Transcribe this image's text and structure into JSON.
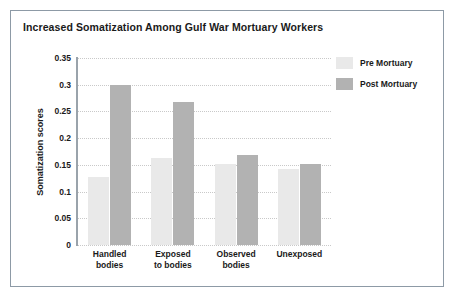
{
  "chart_data": {
    "type": "bar",
    "title": "Increased Somatization Among Gulf War Mortuary Workers",
    "xlabel": "",
    "ylabel": "Somatization scores",
    "categories": [
      "Handled bodies",
      "Exposed to bodies",
      "Observed bodies",
      "Unexposed"
    ],
    "category_lines": [
      [
        "Handled",
        "bodies"
      ],
      [
        "Exposed",
        "to bodies"
      ],
      [
        "Observed",
        "bodies"
      ],
      [
        "Unexposed"
      ]
    ],
    "series": [
      {
        "name": "Pre Mortuary",
        "color": "#e9e9e9",
        "values": [
          0.128,
          0.163,
          0.152,
          0.142
        ]
      },
      {
        "name": "Post Mortuary",
        "color": "#b2b2b2",
        "values": [
          0.3,
          0.268,
          0.168,
          0.152
        ]
      }
    ],
    "ylim": [
      0,
      0.35
    ],
    "yticks": [
      "0",
      "0.05",
      "0.1",
      "0.15",
      "0.2",
      "0.25",
      "0.3",
      "0.35"
    ],
    "ytick_values": [
      0,
      0.05,
      0.1,
      0.15,
      0.2,
      0.25,
      0.3,
      0.35
    ],
    "grid": true,
    "grid_axis": "y",
    "grid_style": "dotted",
    "legend": [
      "Pre Mortuary",
      "Post Mortuary"
    ],
    "legend_position": "right-top"
  },
  "colors": {
    "pre_bar": "#e9e9e9",
    "post_bar": "#b2b2b2",
    "frame_border": "#8d9aa6",
    "axis": "#9aa3ab",
    "gridline": "#c9c9c9",
    "text": "#1a1a1a",
    "background": "#ffffff"
  }
}
